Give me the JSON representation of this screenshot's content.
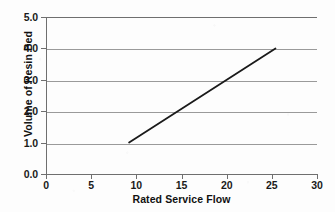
{
  "chart_data": {
    "type": "line",
    "title": "",
    "xlabel": "Rated Service Flow",
    "ylabel": "Volume of Resin Bed",
    "xlim": [
      0,
      30
    ],
    "ylim": [
      0.0,
      5.0
    ],
    "xticks": [
      0,
      5,
      10,
      15,
      20,
      25,
      30
    ],
    "xtick_labels": [
      "0",
      "5",
      "10",
      "15",
      "20",
      "25",
      "30"
    ],
    "yticks": [
      0.0,
      1.0,
      2.0,
      3.0,
      4.0,
      5.0
    ],
    "ytick_labels": [
      "0.0",
      "1.0",
      "2.0",
      "3.0",
      "4.0",
      "5.0"
    ],
    "grid": "horizontal",
    "grid_color": "#9a9a9a",
    "legend": null,
    "legend_position": "none",
    "series": [
      {
        "name": "Volume of Resin Bed",
        "color": "#1a1a1a",
        "line_width": 1.8,
        "x": [
          9.2,
          25.4
        ],
        "values": [
          1.0,
          4.0
        ]
      }
    ],
    "annotations": []
  },
  "axes": {
    "y_tick_labels": [
      "5.0",
      "4.0",
      "3.0",
      "2.0",
      "1.0",
      "0.0"
    ],
    "x_tick_labels": [
      "0",
      "5",
      "10",
      "15",
      "20",
      "25",
      "30"
    ],
    "x_title": "Rated Service Flow",
    "y_title": "Volume of Resin Bed"
  },
  "colors": {
    "background": "#fdfdfd",
    "axis": "#6f6f6f",
    "gridline": "#9a9a9a",
    "series_line": "#1a1a1a",
    "text": "#111111"
  }
}
